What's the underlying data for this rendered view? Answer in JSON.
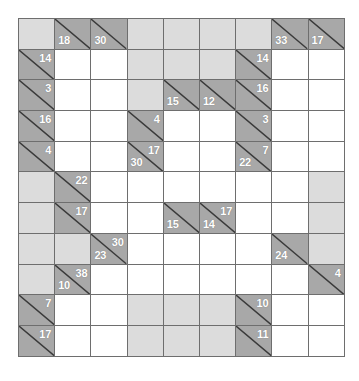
{
  "puzzle": {
    "type": "kakuro",
    "title": "Kakuro grid",
    "columns": 9,
    "rows": 11,
    "colors": {
      "clue_cell": "#a8a8a8",
      "blank_cell": "#dcdcdc",
      "entry_cell": "#ffffff",
      "grid_line": "#6e6e6e",
      "clue_text": "#ffffff",
      "slash": "#3a3a3a"
    },
    "legend": {
      "across_position": "upper-right",
      "down_position": "lower-left"
    },
    "cells": [
      [
        {
          "kind": "blank"
        },
        {
          "kind": "clue",
          "down": "18"
        },
        {
          "kind": "clue",
          "down": "30"
        },
        {
          "kind": "blank"
        },
        {
          "kind": "blank"
        },
        {
          "kind": "blank"
        },
        {
          "kind": "blank"
        },
        {
          "kind": "clue",
          "down": "33"
        },
        {
          "kind": "clue",
          "down": "17"
        }
      ],
      [
        {
          "kind": "clue",
          "across": "14"
        },
        {
          "kind": "white"
        },
        {
          "kind": "white"
        },
        {
          "kind": "blank"
        },
        {
          "kind": "blank"
        },
        {
          "kind": "blank"
        },
        {
          "kind": "clue",
          "across": "14"
        },
        {
          "kind": "white"
        },
        {
          "kind": "white"
        }
      ],
      [
        {
          "kind": "clue",
          "across": "3"
        },
        {
          "kind": "white"
        },
        {
          "kind": "white"
        },
        {
          "kind": "blank"
        },
        {
          "kind": "clue",
          "down": "15"
        },
        {
          "kind": "clue",
          "down": "12"
        },
        {
          "kind": "clue",
          "across": "16"
        },
        {
          "kind": "white"
        },
        {
          "kind": "white"
        }
      ],
      [
        {
          "kind": "clue",
          "across": "16"
        },
        {
          "kind": "white"
        },
        {
          "kind": "white"
        },
        {
          "kind": "clue",
          "across": "4"
        },
        {
          "kind": "white"
        },
        {
          "kind": "white"
        },
        {
          "kind": "clue",
          "across": "3"
        },
        {
          "kind": "white"
        },
        {
          "kind": "white"
        }
      ],
      [
        {
          "kind": "clue",
          "across": "4"
        },
        {
          "kind": "white"
        },
        {
          "kind": "white"
        },
        {
          "kind": "clue",
          "across": "17",
          "down": "30"
        },
        {
          "kind": "white"
        },
        {
          "kind": "white"
        },
        {
          "kind": "clue",
          "across": "7",
          "down": "22"
        },
        {
          "kind": "white"
        },
        {
          "kind": "white"
        }
      ],
      [
        {
          "kind": "blank"
        },
        {
          "kind": "clue",
          "across": "22"
        },
        {
          "kind": "white"
        },
        {
          "kind": "white"
        },
        {
          "kind": "white"
        },
        {
          "kind": "white"
        },
        {
          "kind": "white"
        },
        {
          "kind": "white"
        },
        {
          "kind": "blank"
        }
      ],
      [
        {
          "kind": "blank"
        },
        {
          "kind": "clue",
          "across": "17"
        },
        {
          "kind": "white"
        },
        {
          "kind": "white"
        },
        {
          "kind": "clue",
          "down": "15"
        },
        {
          "kind": "clue",
          "across": "17",
          "down": "14"
        },
        {
          "kind": "white"
        },
        {
          "kind": "white"
        },
        {
          "kind": "blank"
        }
      ],
      [
        {
          "kind": "blank"
        },
        {
          "kind": "blank"
        },
        {
          "kind": "clue",
          "across": "30",
          "down": "23"
        },
        {
          "kind": "white"
        },
        {
          "kind": "white"
        },
        {
          "kind": "white"
        },
        {
          "kind": "white"
        },
        {
          "kind": "clue",
          "down": "24"
        },
        {
          "kind": "blank"
        }
      ],
      [
        {
          "kind": "blank"
        },
        {
          "kind": "clue",
          "across": "38",
          "down": "10"
        },
        {
          "kind": "white"
        },
        {
          "kind": "white"
        },
        {
          "kind": "white"
        },
        {
          "kind": "white"
        },
        {
          "kind": "white"
        },
        {
          "kind": "white"
        },
        {
          "kind": "clue",
          "across": "4"
        }
      ],
      [
        {
          "kind": "clue",
          "across": "7"
        },
        {
          "kind": "white"
        },
        {
          "kind": "white"
        },
        {
          "kind": "blank"
        },
        {
          "kind": "blank"
        },
        {
          "kind": "blank"
        },
        {
          "kind": "clue",
          "across": "10"
        },
        {
          "kind": "white"
        },
        {
          "kind": "white"
        }
      ],
      [
        {
          "kind": "clue",
          "across": "17"
        },
        {
          "kind": "white"
        },
        {
          "kind": "white"
        },
        {
          "kind": "blank"
        },
        {
          "kind": "blank"
        },
        {
          "kind": "blank"
        },
        {
          "kind": "clue",
          "across": "11"
        },
        {
          "kind": "white"
        },
        {
          "kind": "white"
        }
      ]
    ]
  }
}
